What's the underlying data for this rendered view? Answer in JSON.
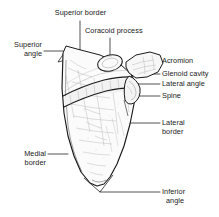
{
  "figure": {
    "background_color": "#ffffff",
    "ink_color": "#1a1a1a",
    "shading_color": "#9a9a9a"
  },
  "labels": {
    "superior_border": "Superior border",
    "coracoid_process": "Coracoid process",
    "superior_angle_line1": "Superior",
    "superior_angle_line2": "angle",
    "acromion": "Acromion",
    "glenoid_cavity": "Glenoid cavity",
    "lateral_angle": "Lateral angle",
    "spine": "Spine",
    "lateral_border_line1": "Lateral",
    "lateral_border_line2": "border",
    "medial_border_line1": "Medial",
    "medial_border_line2": "border",
    "inferior_angle_line1": "Inferior",
    "inferior_angle_line2": "angle"
  }
}
